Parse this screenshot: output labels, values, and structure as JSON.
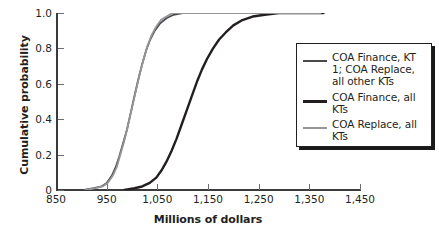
{
  "chart_data": {
    "type": "line",
    "title": "",
    "xlabel": "Millions of dollars",
    "ylabel": "Cumulative probability",
    "xlim": [
      850,
      1450
    ],
    "ylim": [
      0,
      1.0
    ],
    "xticks": [
      "850",
      "950",
      "1,050",
      "1,150",
      "1,250",
      "1,350",
      "1,450"
    ],
    "xtick_values": [
      850,
      950,
      1050,
      1150,
      1250,
      1350,
      1450
    ],
    "yticks": [
      "0",
      "0.2",
      "0.4",
      "0.6",
      "0.8",
      "1.0"
    ],
    "ytick_values": [
      0,
      0.2,
      0.4,
      0.6,
      0.8,
      1.0
    ],
    "grid": false,
    "legend_position": "right",
    "series": [
      {
        "name": "COA Finance, KT 1; COA Replace, all other KTs",
        "color": "#4a4a4c",
        "width": 1.8,
        "points": [
          [
            905,
            0.0
          ],
          [
            925,
            0.01
          ],
          [
            940,
            0.02
          ],
          [
            950,
            0.04
          ],
          [
            960,
            0.08
          ],
          [
            968,
            0.13
          ],
          [
            975,
            0.19
          ],
          [
            982,
            0.26
          ],
          [
            990,
            0.34
          ],
          [
            997,
            0.43
          ],
          [
            1004,
            0.52
          ],
          [
            1012,
            0.62
          ],
          [
            1020,
            0.71
          ],
          [
            1028,
            0.79
          ],
          [
            1036,
            0.85
          ],
          [
            1045,
            0.9
          ],
          [
            1055,
            0.94
          ],
          [
            1068,
            0.97
          ],
          [
            1082,
            0.99
          ],
          [
            1100,
            1.0
          ],
          [
            1160,
            1.0
          ],
          [
            1240,
            1.0
          ],
          [
            1320,
            1.0
          ],
          [
            1375,
            1.0
          ]
        ]
      },
      {
        "name": "COA Finance, all KTs",
        "color": "#231f20",
        "width": 2.4,
        "points": [
          [
            985,
            0.0
          ],
          [
            1005,
            0.01
          ],
          [
            1020,
            0.02
          ],
          [
            1035,
            0.04
          ],
          [
            1048,
            0.07
          ],
          [
            1058,
            0.11
          ],
          [
            1068,
            0.16
          ],
          [
            1078,
            0.22
          ],
          [
            1088,
            0.29
          ],
          [
            1098,
            0.37
          ],
          [
            1108,
            0.45
          ],
          [
            1118,
            0.53
          ],
          [
            1128,
            0.61
          ],
          [
            1138,
            0.68
          ],
          [
            1148,
            0.74
          ],
          [
            1160,
            0.8
          ],
          [
            1172,
            0.85
          ],
          [
            1185,
            0.89
          ],
          [
            1200,
            0.93
          ],
          [
            1218,
            0.96
          ],
          [
            1238,
            0.98
          ],
          [
            1262,
            0.99
          ],
          [
            1290,
            1.0
          ],
          [
            1320,
            1.0
          ],
          [
            1360,
            1.0
          ],
          [
            1378,
            1.0
          ]
        ]
      },
      {
        "name": "COA Replace, all KTs",
        "color": "#939598",
        "width": 1.8,
        "points": [
          [
            908,
            0.0
          ],
          [
            928,
            0.01
          ],
          [
            942,
            0.02
          ],
          [
            952,
            0.04
          ],
          [
            962,
            0.08
          ],
          [
            970,
            0.13
          ],
          [
            977,
            0.2
          ],
          [
            984,
            0.27
          ],
          [
            991,
            0.35
          ],
          [
            998,
            0.44
          ],
          [
            1006,
            0.54
          ],
          [
            1014,
            0.64
          ],
          [
            1022,
            0.73
          ],
          [
            1030,
            0.81
          ],
          [
            1038,
            0.87
          ],
          [
            1047,
            0.92
          ],
          [
            1057,
            0.96
          ],
          [
            1068,
            0.98
          ],
          [
            1080,
            1.0
          ],
          [
            1120,
            1.0
          ],
          [
            1200,
            1.0
          ],
          [
            1280,
            1.0
          ],
          [
            1340,
            1.0
          ],
          [
            1372,
            1.0
          ]
        ]
      }
    ]
  },
  "legend": {
    "entries": [
      {
        "label": "COA Finance, KT 1; COA Replace, all other KTs",
        "color": "#4a4a4c",
        "width": 2
      },
      {
        "label": "COA Finance, all KTs",
        "color": "#231f20",
        "width": 3
      },
      {
        "label": "COA Replace, all KTs",
        "color": "#939598",
        "width": 2
      }
    ]
  },
  "colors": {
    "axis": "#3b3b3d",
    "tick": "#6d6e71",
    "text": "#231f20",
    "background": "#ffffff"
  }
}
